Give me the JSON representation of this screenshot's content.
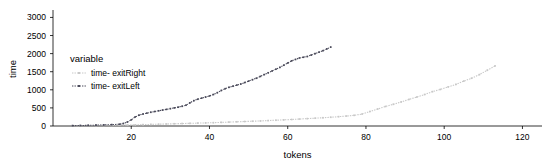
{
  "chart_data": {
    "type": "line",
    "title": "",
    "xlabel": "tokens",
    "ylabel": "time",
    "xlim": [
      0,
      125
    ],
    "ylim": [
      0,
      3150
    ],
    "xticks": [
      20,
      40,
      60,
      80,
      100,
      120
    ],
    "xtick_labels": [
      "20",
      "40",
      "60",
      "80",
      "100",
      "120"
    ],
    "yticks": [
      0,
      500,
      1000,
      1500,
      2000,
      2500,
      3000
    ],
    "ytick_labels": [
      "0",
      "500",
      "1000",
      "1500",
      "2000",
      "2500",
      "3000"
    ],
    "grid": false,
    "legend": {
      "title": "variable",
      "position": "inside-upper-left",
      "entries": [
        {
          "name": "time- exitRight",
          "color": "#c8c8c8",
          "marker": "dotted-line"
        },
        {
          "name": "time- exitLeft",
          "color": "#4a4a5a",
          "marker": "dotted-line"
        }
      ]
    },
    "series": [
      {
        "name": "time- exitRight",
        "color": "#c8c8c8",
        "x": [
          5,
          7,
          9,
          11,
          13,
          15,
          17,
          19,
          21,
          23,
          25,
          27,
          29,
          31,
          33,
          35,
          37,
          39,
          41,
          43,
          45,
          47,
          49,
          51,
          53,
          55,
          57,
          59,
          61,
          63,
          65,
          67,
          69,
          71,
          73,
          75,
          77,
          79,
          81,
          83,
          85,
          87,
          89,
          91,
          93,
          95,
          97,
          99,
          101,
          103,
          105,
          107,
          109,
          111,
          113
        ],
        "y": [
          10,
          12,
          14,
          16,
          18,
          20,
          24,
          28,
          32,
          38,
          44,
          50,
          56,
          62,
          68,
          74,
          80,
          86,
          92,
          100,
          108,
          116,
          124,
          132,
          140,
          150,
          160,
          170,
          180,
          192,
          204,
          216,
          228,
          242,
          258,
          275,
          295,
          330,
          400,
          470,
          540,
          600,
          665,
          735,
          800,
          870,
          950,
          1010,
          1080,
          1150,
          1240,
          1320,
          1420,
          1540,
          1660
        ]
      },
      {
        "name": "time- exitLeft",
        "color": "#4a4a5a",
        "x": [
          5,
          7,
          9,
          11,
          13,
          15,
          17,
          18,
          19,
          20,
          21,
          22,
          23,
          24,
          25,
          26,
          27,
          28,
          29,
          30,
          31,
          32,
          33,
          34,
          35,
          36,
          37,
          38,
          39,
          40,
          41,
          42,
          43,
          44,
          45,
          46,
          47,
          48,
          49,
          50,
          51,
          52,
          53,
          54,
          55,
          56,
          57,
          58,
          59,
          60,
          61,
          62,
          63,
          64,
          65,
          66,
          67,
          68,
          69,
          70,
          71
        ],
        "y": [
          10,
          14,
          18,
          24,
          30,
          38,
          50,
          70,
          110,
          170,
          250,
          300,
          330,
          355,
          380,
          400,
          420,
          440,
          460,
          480,
          500,
          520,
          545,
          575,
          640,
          700,
          740,
          770,
          800,
          830,
          870,
          920,
          980,
          1030,
          1070,
          1100,
          1130,
          1160,
          1200,
          1240,
          1280,
          1320,
          1370,
          1420,
          1470,
          1520,
          1570,
          1620,
          1680,
          1740,
          1800,
          1840,
          1880,
          1900,
          1920,
          1960,
          2000,
          2040,
          2080,
          2130,
          2180
        ]
      }
    ]
  }
}
